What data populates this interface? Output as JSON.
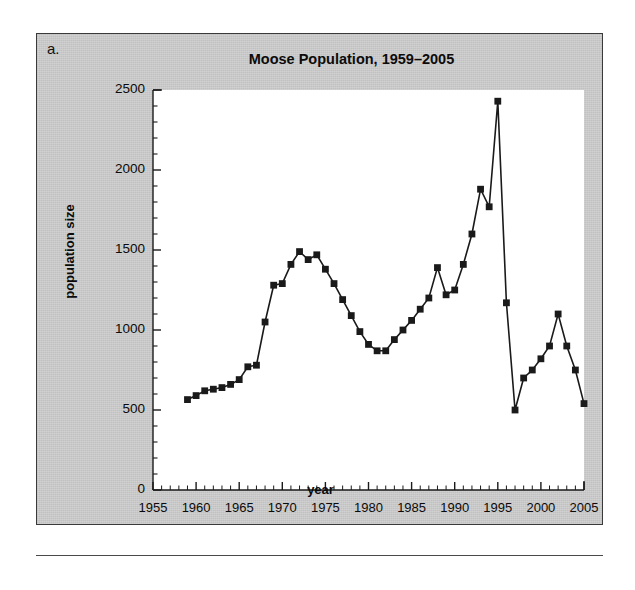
{
  "figure": {
    "panel_letter": "a.",
    "background_color": "#c8c8c8",
    "plot_background_color": "#ffffff",
    "marker_color": "#1a1a1a",
    "line_color": "#1a1a1a"
  },
  "chart_data": {
    "type": "line",
    "title": "Moose Population, 1959–2005",
    "xlabel": "year",
    "ylabel": "population size",
    "xlim": [
      1955,
      2005
    ],
    "ylim": [
      0,
      2500
    ],
    "xticks": [
      1955,
      1960,
      1965,
      1970,
      1975,
      1980,
      1985,
      1990,
      1995,
      2000,
      2005
    ],
    "xtick_labels": [
      "1955",
      "1960",
      "1965",
      "1970",
      "1975",
      "1980",
      "1985",
      "1990",
      "1995",
      "2000",
      "2005"
    ],
    "yticks": [
      0,
      500,
      1000,
      1500,
      2000,
      2500
    ],
    "ytick_labels": [
      "0",
      "500",
      "1000",
      "1500",
      "2000",
      "2500"
    ],
    "x_minor_tick_interval": 1,
    "y_minor_tick_interval": 100,
    "grid": false,
    "legend": null,
    "marker": "square",
    "series": [
      {
        "name": "Moose population",
        "x": [
          1959,
          1960,
          1961,
          1962,
          1963,
          1964,
          1965,
          1966,
          1967,
          1968,
          1969,
          1970,
          1971,
          1972,
          1973,
          1974,
          1975,
          1976,
          1977,
          1978,
          1979,
          1980,
          1981,
          1982,
          1983,
          1984,
          1985,
          1986,
          1987,
          1988,
          1989,
          1990,
          1991,
          1992,
          1993,
          1994,
          1995,
          1996,
          1997,
          1998,
          1999,
          2000,
          2001,
          2002,
          2003,
          2004,
          2005
        ],
        "values": [
          565,
          590,
          620,
          630,
          640,
          660,
          690,
          770,
          780,
          1050,
          1280,
          1290,
          1410,
          1490,
          1440,
          1470,
          1380,
          1290,
          1190,
          1090,
          990,
          910,
          870,
          870,
          940,
          1000,
          1060,
          1130,
          1200,
          1390,
          1220,
          1250,
          1410,
          1600,
          1880,
          1770,
          2430,
          1170,
          500,
          700,
          750,
          820,
          900,
          1100,
          900,
          750,
          540
        ]
      }
    ]
  }
}
